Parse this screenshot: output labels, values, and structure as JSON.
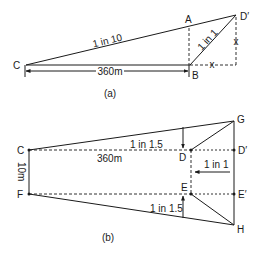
{
  "figure_a": {
    "caption": "(a)",
    "points": {
      "C": "C",
      "A": "A",
      "B": "B",
      "D_prime": "D′"
    },
    "slope_main": "1 in 10",
    "slope_side": "1 in 1",
    "dimension": "360m",
    "offset_h": "x",
    "offset_v": "x"
  },
  "figure_b": {
    "caption": "(b)",
    "points": {
      "C": "C",
      "F": "F",
      "G": "G",
      "H": "H",
      "D": "D",
      "E": "E",
      "D_prime": "D′",
      "E_prime": "E′"
    },
    "slope_top": "1 in 1.5",
    "slope_bottom": "1 in 1.5",
    "slope_end": "1 in 1",
    "length": "360m",
    "width": "10m"
  }
}
